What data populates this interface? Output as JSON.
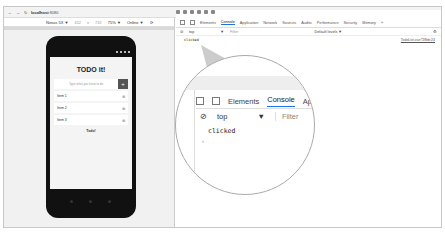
{
  "browser": {
    "url_host": "localhost",
    "url_port": ":8080"
  },
  "device_toolbar": {
    "device": "Nexus 5X ▼",
    "width": "412",
    "times": "x",
    "height": "732",
    "zoom": "75% ▼",
    "network": "Online ▼"
  },
  "app": {
    "title": "TODO it!",
    "input_placeholder": "Type what you have to do",
    "add_label": "+",
    "items": [
      {
        "label": "Item 1"
      },
      {
        "label": "Item 2"
      },
      {
        "label": "Item 3"
      }
    ],
    "footer": "Todo!"
  },
  "devtools": {
    "tabs": [
      "Elements",
      "Console",
      "Application",
      "Network",
      "Sources",
      "Audits",
      "Performance",
      "Security",
      "Memory",
      "»"
    ],
    "active_tab": "Console",
    "context": "top",
    "context_arrow": "▼",
    "filter_placeholder": "Filter",
    "levels": "Default levels ▼",
    "log_message": "clicked",
    "log_source": "TodoList.vue?28bb:24",
    "prompt": "›"
  },
  "callout": {
    "tab_elements": "Elements",
    "tab_console": "Console",
    "tab_partial": "App",
    "context": "top",
    "arrow": "▼",
    "filter": "Filter",
    "log": "clicked",
    "prompt": "›"
  }
}
